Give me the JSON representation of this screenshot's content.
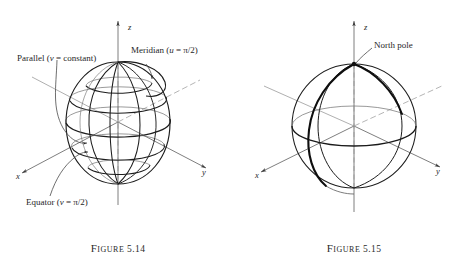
{
  "page": {
    "background": "#ffffff",
    "ink": "#1a1a1a",
    "faint_ink": "#8a8a8a"
  },
  "figures": [
    {
      "id": "figure-5-14",
      "caption_word": "Figure",
      "caption_number": "5.14",
      "axes": [
        {
          "name": "x",
          "label": "x"
        },
        {
          "name": "y",
          "label": "y"
        },
        {
          "name": "z",
          "label": "z"
        }
      ],
      "annotations": [
        {
          "name": "parallel",
          "text": "Parallel (v = constant)"
        },
        {
          "name": "meridian",
          "text": "Meridian (u = π/2)"
        },
        {
          "name": "equator",
          "text": "Equator (v = π/2)"
        }
      ]
    },
    {
      "id": "figure-5-15",
      "caption_word": "Figure",
      "caption_number": "5.15",
      "axes": [
        {
          "name": "x",
          "label": "x"
        },
        {
          "name": "y",
          "label": "y"
        },
        {
          "name": "z",
          "label": "z"
        }
      ],
      "annotations": [
        {
          "name": "north-pole",
          "text": "North pole"
        }
      ]
    }
  ],
  "chart_data": {
    "type": "diagram",
    "panels": [
      {
        "label": "Figure 5.14",
        "description": "Sphere drawn as a grid of meridians (u = constant curves running pole to pole) and parallels (v = constant circles of latitude), with x, y, z coordinate axes through the centre.",
        "sphere_center": [
          118,
          122
        ],
        "sphere_radius_x": 52,
        "sphere_radius_y": 60,
        "meridian_count": 5,
        "parallel_count": 5,
        "callouts": [
          "Parallel (v = constant)",
          "Meridian (u = π/2)",
          "Equator (v = π/2)"
        ]
      },
      {
        "label": "Figure 5.15",
        "description": "Sphere showing the outline circle, the equator ellipse and two great-circle meridians meeting at the north pole; the front-left meridian is drawn in heavy ink.",
        "sphere_center": [
          118,
          122
        ],
        "sphere_radius_x": 62,
        "sphere_radius_y": 62,
        "callouts": [
          "North pole"
        ]
      }
    ]
  }
}
